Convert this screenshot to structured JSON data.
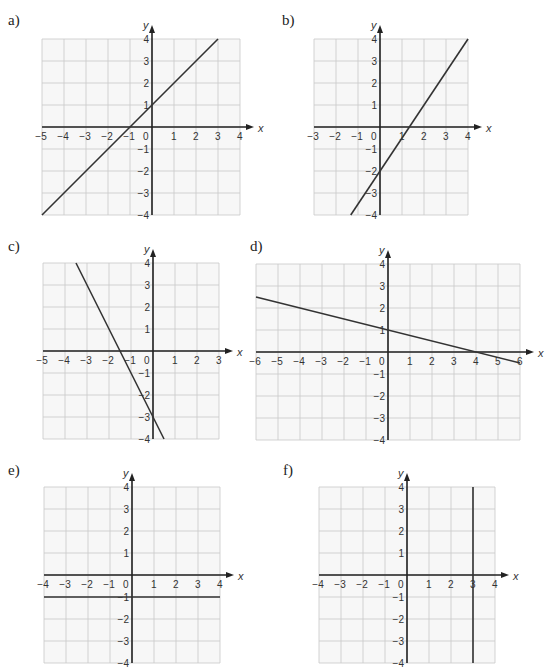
{
  "title": "",
  "chart_data": [
    {
      "type": "line",
      "label": "a)",
      "title": "",
      "xlabel": "x",
      "ylabel": "y",
      "xlim": [
        -5,
        4
      ],
      "ylim": [
        -4,
        4
      ],
      "grid": true,
      "x_ticks": [
        -5,
        -4,
        -3,
        -2,
        -1,
        0,
        1,
        2,
        3,
        4
      ],
      "y_ticks": [
        -4,
        -3,
        -2,
        -1,
        1,
        2,
        3,
        4
      ],
      "series": [
        {
          "name": "line",
          "equation": "y = x + 1",
          "points": [
            [
              -5,
              -4
            ],
            [
              3,
              4
            ]
          ]
        }
      ]
    },
    {
      "type": "line",
      "label": "b)",
      "title": "",
      "xlabel": "x",
      "ylabel": "y",
      "xlim": [
        -3,
        4
      ],
      "ylim": [
        -4,
        4
      ],
      "grid": true,
      "x_ticks": [
        -3,
        -2,
        -1,
        0,
        1,
        2,
        3,
        4
      ],
      "y_ticks": [
        -4,
        -3,
        -2,
        -1,
        1,
        2,
        3,
        4
      ],
      "series": [
        {
          "name": "line",
          "equation": "y = 1.5x - 2",
          "points": [
            [
              -1.33,
              -4
            ],
            [
              4,
              4
            ]
          ]
        }
      ]
    },
    {
      "type": "line",
      "label": "c)",
      "title": "",
      "xlabel": "x",
      "ylabel": "y",
      "xlim": [
        -5,
        3
      ],
      "ylim": [
        -4,
        4
      ],
      "grid": true,
      "x_ticks": [
        -5,
        -4,
        -3,
        -2,
        -1,
        0,
        1,
        2,
        3
      ],
      "y_ticks": [
        -4,
        -3,
        -2,
        -1,
        1,
        2,
        3,
        4
      ],
      "series": [
        {
          "name": "line",
          "equation": "y = -2x - 3",
          "points": [
            [
              -3.5,
              4
            ],
            [
              0.5,
              -4
            ]
          ]
        }
      ]
    },
    {
      "type": "line",
      "label": "d)",
      "title": "",
      "xlabel": "x",
      "ylabel": "y",
      "xlim": [
        -6,
        6
      ],
      "ylim": [
        -4,
        4
      ],
      "grid": true,
      "x_ticks": [
        -6,
        -5,
        -4,
        -3,
        -2,
        -1,
        0,
        1,
        2,
        3,
        4,
        5,
        6
      ],
      "y_ticks": [
        -4,
        -3,
        -2,
        -1,
        1,
        2,
        3,
        4
      ],
      "series": [
        {
          "name": "line",
          "equation": "y = -0.25x + 1",
          "points": [
            [
              -6,
              2.5
            ],
            [
              6,
              -0.5
            ]
          ]
        }
      ]
    },
    {
      "type": "line",
      "label": "e)",
      "title": "",
      "xlabel": "x",
      "ylabel": "y",
      "xlim": [
        -4,
        4
      ],
      "ylim": [
        -4,
        4
      ],
      "grid": true,
      "x_ticks": [
        -4,
        -3,
        -2,
        -1,
        0,
        1,
        2,
        3,
        4
      ],
      "y_ticks": [
        -4,
        -3,
        -2,
        -1,
        1,
        2,
        3,
        4
      ],
      "series": [
        {
          "name": "line",
          "equation": "y = -1",
          "points": [
            [
              -4,
              -1
            ],
            [
              4,
              -1
            ]
          ]
        }
      ]
    },
    {
      "type": "line",
      "label": "f)",
      "title": "",
      "xlabel": "x",
      "ylabel": "y",
      "xlim": [
        -4,
        4
      ],
      "ylim": [
        -4,
        4
      ],
      "grid": true,
      "x_ticks": [
        -4,
        -3,
        -2,
        -1,
        0,
        1,
        2,
        3,
        4
      ],
      "y_ticks": [
        -4,
        -3,
        -2,
        -1,
        1,
        2,
        3,
        4
      ],
      "series": [
        {
          "name": "line",
          "equation": "x = 3",
          "points": [
            [
              3,
              -4
            ],
            [
              3,
              4
            ]
          ]
        }
      ]
    }
  ],
  "layout": [
    {
      "originX": 152,
      "originY": 127,
      "labelX": 8,
      "labelY": 12
    },
    {
      "originX": 380,
      "originY": 127,
      "labelX": 282,
      "labelY": 12
    },
    {
      "originX": 153,
      "originY": 351,
      "labelX": 8,
      "labelY": 238
    },
    {
      "originX": 388,
      "originY": 352,
      "labelX": 250,
      "labelY": 238
    },
    {
      "originX": 132,
      "originY": 575,
      "labelX": 8,
      "labelY": 462
    },
    {
      "originX": 407,
      "originY": 575,
      "labelX": 283,
      "labelY": 462
    }
  ],
  "cell": 22
}
